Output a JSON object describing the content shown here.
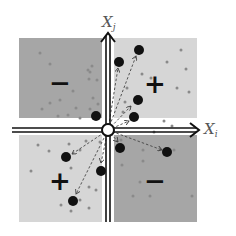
{
  "axes": {
    "vertical_label": "X_j",
    "vertical_label_main": "X",
    "vertical_label_sub": "j",
    "horizontal_label": "X_i",
    "horizontal_label_main": "X",
    "horizontal_label_sub": "i"
  },
  "quadrants": {
    "top_left": {
      "sign": "−",
      "color": "#a6a6a6"
    },
    "top_right": {
      "sign": "+",
      "color": "#d6d6d6"
    },
    "bottom_left": {
      "sign": "+",
      "color": "#d6d6d6"
    },
    "bottom_right": {
      "sign": "−",
      "color": "#a6a6a6"
    }
  },
  "colors": {
    "axis": "#111111",
    "big_dot": "#111111",
    "small_dot": "#8a8a8a",
    "arrow": "#444444"
  }
}
